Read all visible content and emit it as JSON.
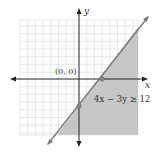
{
  "diagram": {
    "type": "linear-inequality-graph",
    "inequality_label": "4x − 3y ≥ 12",
    "test_point_label": "(0, 0)",
    "x_axis_label": "x",
    "y_axis_label": "y",
    "boundary_line": {
      "equation": "4x − 3y = 12",
      "style": "solid"
    },
    "intercepts": [
      {
        "x": 3,
        "y": 0
      },
      {
        "x": 0,
        "y": -4
      }
    ],
    "shaded_region": "below-right of line",
    "grid": {
      "x_range": [
        -8,
        7
      ],
      "y_range": [
        -7,
        8
      ]
    },
    "colors": {
      "shade": "#bdbdbd",
      "line": "#7a7a7a",
      "grid": "#d4d4d4",
      "axis": "#222222"
    }
  }
}
